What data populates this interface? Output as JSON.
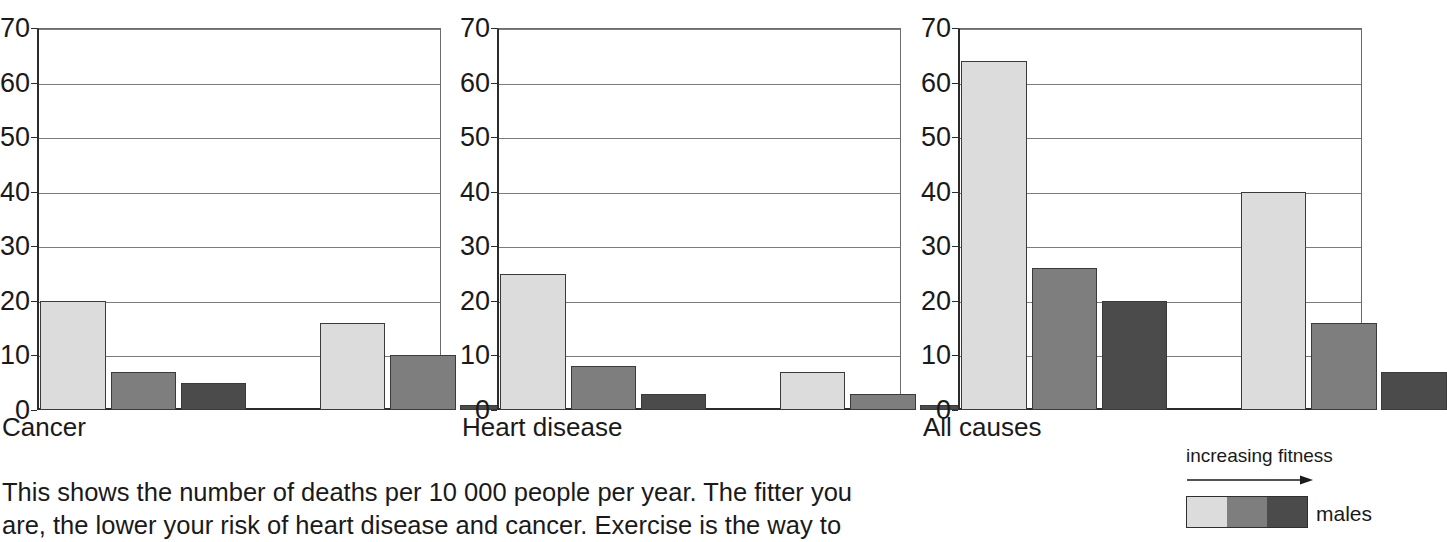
{
  "chart_data": [
    {
      "type": "bar",
      "title": "Cancer",
      "xlabel": "",
      "ylabel": "",
      "ylim": [
        0,
        70
      ],
      "yticks": [
        0,
        10,
        20,
        30,
        40,
        50,
        60,
        70
      ],
      "grid": true,
      "categories": [
        "males",
        "females"
      ],
      "series": [
        {
          "name": "low fitness",
          "values": [
            20,
            16
          ]
        },
        {
          "name": "medium fitness",
          "values": [
            7,
            10
          ]
        },
        {
          "name": "high fitness",
          "values": [
            5,
            1
          ]
        }
      ]
    },
    {
      "type": "bar",
      "title": "Heart disease",
      "xlabel": "",
      "ylabel": "",
      "ylim": [
        0,
        70
      ],
      "yticks": [
        0,
        10,
        20,
        30,
        40,
        50,
        60,
        70
      ],
      "grid": true,
      "categories": [
        "males",
        "females"
      ],
      "series": [
        {
          "name": "low fitness",
          "values": [
            25,
            7
          ]
        },
        {
          "name": "medium fitness",
          "values": [
            8,
            3
          ]
        },
        {
          "name": "high fitness",
          "values": [
            3,
            1
          ]
        }
      ]
    },
    {
      "type": "bar",
      "title": "All causes",
      "xlabel": "",
      "ylabel": "",
      "ylim": [
        0,
        70
      ],
      "yticks": [
        0,
        10,
        20,
        30,
        40,
        50,
        60,
        70
      ],
      "grid": true,
      "categories": [
        "males",
        "females"
      ],
      "series": [
        {
          "name": "low fitness",
          "values": [
            64,
            40
          ]
        },
        {
          "name": "medium fitness",
          "values": [
            26,
            16
          ]
        },
        {
          "name": "high fitness",
          "values": [
            20,
            7
          ]
        }
      ]
    }
  ],
  "panels": [
    {
      "label": "Cancer"
    },
    {
      "label": "Heart disease"
    },
    {
      "label": "All causes"
    }
  ],
  "axis": {
    "ticks": [
      "70",
      "60",
      "50",
      "40",
      "30",
      "20",
      "10",
      "0"
    ]
  },
  "legend": {
    "title": "increasing fitness",
    "series_label": "males",
    "swatches": [
      "#dcdcdc",
      "#7e7e7e",
      "#4b4b4b"
    ]
  },
  "caption": {
    "line1": "This shows the number of deaths per 10 000 people per year. The fitter you",
    "line2": "are, the lower your risk of heart disease and cancer. Exercise is the way to"
  },
  "colors": {
    "light": "#dcdcdc",
    "medium": "#7e7e7e",
    "dark": "#4b4b4b",
    "axis": "#2b2b2b",
    "grid": "#7c7c7c",
    "text": "#1a1a1a"
  }
}
